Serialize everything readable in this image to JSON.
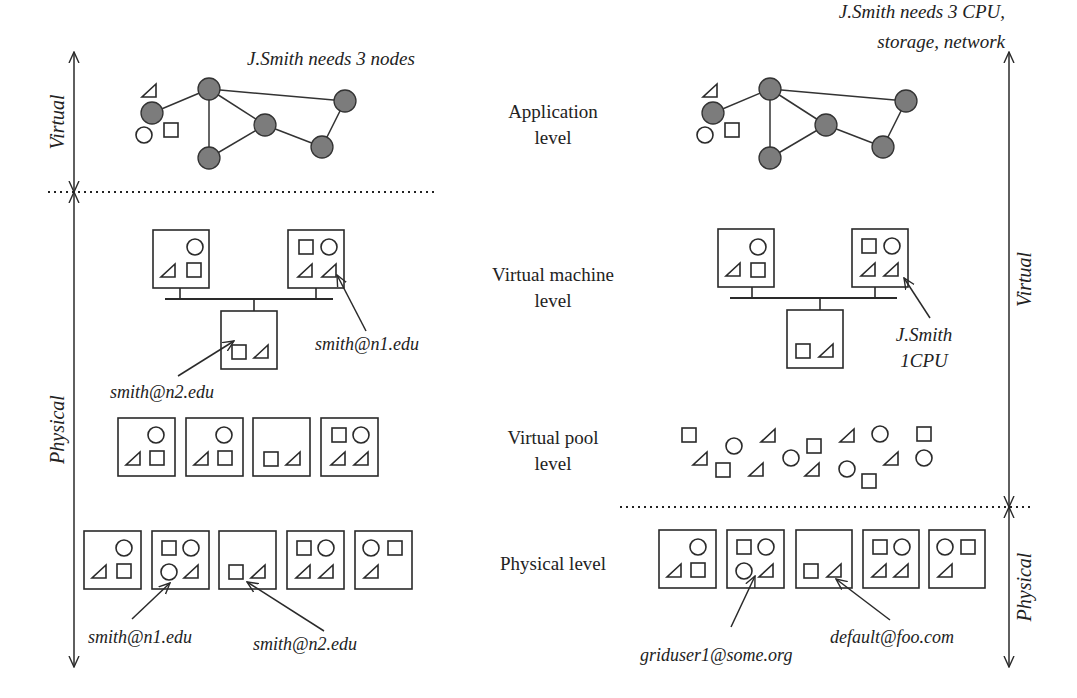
{
  "level_labels": [
    {
      "id": "application",
      "lines": [
        "Application",
        "level"
      ],
      "x": 553,
      "y": 118
    },
    {
      "id": "virtual-machine",
      "lines": [
        "Virtual machine",
        "level"
      ],
      "x": 553,
      "y": 281
    },
    {
      "id": "virtual-pool",
      "lines": [
        "Virtual pool",
        "level"
      ],
      "x": 553,
      "y": 444
    },
    {
      "id": "physical",
      "lines": [
        "Physical level"
      ],
      "x": 553,
      "y": 570
    }
  ],
  "left": {
    "request_label": "J.Smith needs 3 nodes",
    "request_pos": {
      "x": 247,
      "y": 65
    },
    "axis": [
      {
        "label": "Virtual",
        "x": 74,
        "y1": 52,
        "y2": 192
      },
      {
        "label": "Physical",
        "x": 74,
        "y1": 192,
        "y2": 667
      }
    ],
    "divider": {
      "x1": 48,
      "x2": 437,
      "y": 192
    },
    "graph_offset": {
      "x": 0,
      "y": 0
    },
    "vm_boxes": [
      {
        "x": 153,
        "y": 230,
        "w": 56,
        "h": 58,
        "shapes": [
          {
            "t": "c",
            "x": 42,
            "y": 17
          },
          {
            "t": "tri",
            "x": 16,
            "y": 41
          },
          {
            "t": "sq",
            "x": 41,
            "y": 40
          }
        ]
      },
      {
        "x": 288,
        "y": 230,
        "w": 56,
        "h": 58,
        "shapes": [
          {
            "t": "sq",
            "x": 18,
            "y": 17
          },
          {
            "t": "c",
            "x": 41,
            "y": 17
          },
          {
            "t": "tri",
            "x": 18,
            "y": 41
          },
          {
            "t": "tri",
            "x": 42,
            "y": 41
          }
        ]
      },
      {
        "x": 221,
        "y": 311,
        "w": 56,
        "h": 58,
        "shapes": [
          {
            "t": "sq",
            "x": 18,
            "y": 41
          },
          {
            "t": "tri",
            "x": 41,
            "y": 41
          }
        ]
      }
    ],
    "bus": {
      "x1": 165,
      "x2": 333,
      "y": 299,
      "drops": [
        {
          "x": 180,
          "y1": 288,
          "y2": 299
        },
        {
          "x": 316,
          "y1": 288,
          "y2": 299
        },
        {
          "x": 254,
          "y1": 299,
          "y2": 311
        }
      ]
    },
    "vm_annotations": [
      {
        "text": "smith@n2.edu",
        "tx": 110,
        "ty": 398,
        "ax1": 178,
        "ay1": 376,
        "ax2": 234,
        "ay2": 341
      },
      {
        "text": "smith@n1.edu",
        "tx": 315,
        "ty": 350,
        "ax1": 366,
        "ay1": 331,
        "ax2": 337,
        "ay2": 275
      }
    ],
    "pool_boxes": [
      {
        "x": 118,
        "y": 418,
        "w": 57,
        "h": 58,
        "shapes": [
          {
            "t": "c",
            "x": 38,
            "y": 17
          },
          {
            "t": "tri",
            "x": 16,
            "y": 41
          },
          {
            "t": "sq",
            "x": 39,
            "y": 40
          }
        ]
      },
      {
        "x": 186,
        "y": 418,
        "w": 57,
        "h": 58,
        "shapes": [
          {
            "t": "c",
            "x": 38,
            "y": 17
          },
          {
            "t": "tri",
            "x": 16,
            "y": 41
          },
          {
            "t": "sq",
            "x": 39,
            "y": 40
          }
        ]
      },
      {
        "x": 253,
        "y": 418,
        "w": 57,
        "h": 58,
        "shapes": [
          {
            "t": "sq",
            "x": 18,
            "y": 41
          },
          {
            "t": "tri",
            "x": 41,
            "y": 41
          }
        ]
      },
      {
        "x": 321,
        "y": 418,
        "w": 57,
        "h": 58,
        "shapes": [
          {
            "t": "sq",
            "x": 18,
            "y": 17
          },
          {
            "t": "c",
            "x": 40,
            "y": 17
          },
          {
            "t": "tri",
            "x": 18,
            "y": 41
          },
          {
            "t": "tri",
            "x": 41,
            "y": 41
          }
        ]
      }
    ],
    "phys_boxes": [
      {
        "x": 84,
        "y": 531,
        "w": 57,
        "h": 58,
        "shapes": [
          {
            "t": "c",
            "x": 40,
            "y": 17
          },
          {
            "t": "tri",
            "x": 16,
            "y": 41
          },
          {
            "t": "sq",
            "x": 40,
            "y": 40
          }
        ]
      },
      {
        "x": 152,
        "y": 531,
        "w": 57,
        "h": 58,
        "shapes": [
          {
            "t": "sq",
            "x": 17,
            "y": 17
          },
          {
            "t": "c",
            "x": 39,
            "y": 17
          },
          {
            "t": "c",
            "x": 17,
            "y": 41
          },
          {
            "t": "tri",
            "x": 40,
            "y": 41
          }
        ]
      },
      {
        "x": 219,
        "y": 531,
        "w": 57,
        "h": 58,
        "shapes": [
          {
            "t": "sq",
            "x": 17,
            "y": 41
          },
          {
            "t": "tri",
            "x": 40,
            "y": 41
          }
        ]
      },
      {
        "x": 287,
        "y": 531,
        "w": 57,
        "h": 58,
        "shapes": [
          {
            "t": "sq",
            "x": 17,
            "y": 17
          },
          {
            "t": "c",
            "x": 39,
            "y": 17
          },
          {
            "t": "tri",
            "x": 17,
            "y": 41
          },
          {
            "t": "tri",
            "x": 40,
            "y": 41
          }
        ]
      },
      {
        "x": 355,
        "y": 531,
        "w": 57,
        "h": 58,
        "shapes": [
          {
            "t": "c",
            "x": 16,
            "y": 17
          },
          {
            "t": "sq",
            "x": 40,
            "y": 17
          },
          {
            "t": "tri",
            "x": 17,
            "y": 41
          }
        ]
      }
    ],
    "phys_annotations": [
      {
        "text": "smith@n1.edu",
        "tx": 88,
        "ty": 643,
        "ax1": 132,
        "ay1": 619,
        "ax2": 170,
        "ay2": 583
      },
      {
        "text": "smith@n2.edu",
        "tx": 253,
        "ty": 650,
        "ax1": 324,
        "ay1": 631,
        "ax2": 247,
        "ay2": 582
      }
    ]
  },
  "right": {
    "request_label_lines": [
      "J.Smith needs 3 CPU,",
      "storage, network"
    ],
    "request_pos": {
      "x": 1005,
      "y": 48
    },
    "axis": [
      {
        "label": "Virtual",
        "x": 1009,
        "y1": 52,
        "y2": 507
      },
      {
        "label": "Physical",
        "x": 1009,
        "y1": 507,
        "y2": 667
      }
    ],
    "divider": {
      "x1": 620,
      "x2": 1030,
      "y": 507
    },
    "graph_offset": {
      "x": 561,
      "y": 0
    },
    "vm_boxes": [
      {
        "x": 718,
        "y": 229,
        "w": 56,
        "h": 58,
        "shapes": [
          {
            "t": "c",
            "x": 40,
            "y": 18
          },
          {
            "t": "tri",
            "x": 16,
            "y": 41
          },
          {
            "t": "sq",
            "x": 40,
            "y": 41
          }
        ]
      },
      {
        "x": 852,
        "y": 229,
        "w": 56,
        "h": 58,
        "shapes": [
          {
            "t": "sq",
            "x": 17,
            "y": 17
          },
          {
            "t": "c",
            "x": 40,
            "y": 17
          },
          {
            "t": "tri",
            "x": 17,
            "y": 41
          },
          {
            "t": "tri",
            "x": 40,
            "y": 41
          }
        ]
      },
      {
        "x": 787,
        "y": 310,
        "w": 56,
        "h": 58,
        "shapes": [
          {
            "t": "sq",
            "x": 16,
            "y": 41
          },
          {
            "t": "tri",
            "x": 40,
            "y": 41
          }
        ]
      }
    ],
    "bus": {
      "x1": 730,
      "x2": 897,
      "y": 298,
      "drops": [
        {
          "x": 752,
          "y1": 287,
          "y2": 298
        },
        {
          "x": 875,
          "y1": 287,
          "y2": 298
        },
        {
          "x": 820,
          "y1": 298,
          "y2": 310
        }
      ]
    },
    "vm_annotations": [
      {
        "text_lines": [
          "J.Smith",
          "1CPU"
        ],
        "tx": 894,
        "ty": 341,
        "ax1": 930,
        "ay1": 318,
        "ax2": 904,
        "ay2": 278
      }
    ],
    "pool_shapes": [
      {
        "t": "sq",
        "x": 689,
        "y": 435
      },
      {
        "t": "c",
        "x": 734,
        "y": 446
      },
      {
        "t": "tri",
        "x": 769,
        "y": 436
      },
      {
        "t": "sq",
        "x": 814,
        "y": 446
      },
      {
        "t": "tri",
        "x": 848,
        "y": 436
      },
      {
        "t": "c",
        "x": 880,
        "y": 434
      },
      {
        "t": "sq",
        "x": 924,
        "y": 434
      },
      {
        "t": "tri",
        "x": 701,
        "y": 459
      },
      {
        "t": "sq",
        "x": 723,
        "y": 470
      },
      {
        "t": "tri",
        "x": 757,
        "y": 470
      },
      {
        "t": "c",
        "x": 791,
        "y": 458
      },
      {
        "t": "tri",
        "x": 813,
        "y": 470
      },
      {
        "t": "c",
        "x": 847,
        "y": 469
      },
      {
        "t": "sq",
        "x": 869,
        "y": 481
      },
      {
        "t": "tri",
        "x": 892,
        "y": 459
      },
      {
        "t": "c",
        "x": 924,
        "y": 458
      }
    ],
    "phys_boxes": [
      {
        "x": 659,
        "y": 530,
        "w": 57,
        "h": 58,
        "shapes": [
          {
            "t": "c",
            "x": 39,
            "y": 17
          },
          {
            "t": "tri",
            "x": 16,
            "y": 41
          },
          {
            "t": "sq",
            "x": 39,
            "y": 40
          }
        ]
      },
      {
        "x": 727,
        "y": 530,
        "w": 57,
        "h": 58,
        "shapes": [
          {
            "t": "sq",
            "x": 17,
            "y": 17
          },
          {
            "t": "c",
            "x": 39,
            "y": 17
          },
          {
            "t": "c",
            "x": 17,
            "y": 41
          },
          {
            "t": "tri",
            "x": 40,
            "y": 41
          }
        ]
      },
      {
        "x": 796,
        "y": 530,
        "w": 56,
        "h": 58,
        "shapes": [
          {
            "t": "sq",
            "x": 15,
            "y": 41
          },
          {
            "t": "tri",
            "x": 39,
            "y": 41
          }
        ]
      },
      {
        "x": 863,
        "y": 530,
        "w": 56,
        "h": 58,
        "shapes": [
          {
            "t": "sq",
            "x": 17,
            "y": 17
          },
          {
            "t": "c",
            "x": 39,
            "y": 17
          },
          {
            "t": "tri",
            "x": 17,
            "y": 41
          },
          {
            "t": "tri",
            "x": 39,
            "y": 41
          }
        ]
      },
      {
        "x": 929,
        "y": 530,
        "w": 56,
        "h": 58,
        "shapes": [
          {
            "t": "c",
            "x": 16,
            "y": 17
          },
          {
            "t": "sq",
            "x": 39,
            "y": 17
          },
          {
            "t": "tri",
            "x": 17,
            "y": 41
          }
        ]
      }
    ],
    "phys_annotations": [
      {
        "text": "griduser1@some.org",
        "tx": 640,
        "ty": 661,
        "ax1": 731,
        "ay1": 627,
        "ax2": 755,
        "ay2": 576
      },
      {
        "text": "default@foo.com",
        "tx": 830,
        "ty": 643,
        "ax1": 890,
        "ay1": 620,
        "ax2": 836,
        "ay2": 579
      }
    ]
  },
  "graph": {
    "nodes": [
      {
        "x": 152,
        "y": 113
      },
      {
        "x": 209,
        "y": 89
      },
      {
        "x": 265,
        "y": 125
      },
      {
        "x": 209,
        "y": 158
      },
      {
        "x": 322,
        "y": 147
      },
      {
        "x": 345,
        "y": 101
      }
    ],
    "edges": [
      [
        0,
        1
      ],
      [
        1,
        2
      ],
      [
        1,
        3
      ],
      [
        3,
        2
      ],
      [
        2,
        4
      ],
      [
        4,
        5
      ],
      [
        1,
        5
      ]
    ],
    "extras": [
      {
        "t": "tri",
        "x": 150,
        "y": 91
      },
      {
        "t": "c",
        "x": 144,
        "y": 135
      },
      {
        "t": "sq",
        "x": 171,
        "y": 130
      }
    ],
    "node_radius": 11,
    "node_color": "#7c7c7c"
  }
}
